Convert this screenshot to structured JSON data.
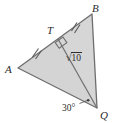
{
  "figure": {
    "kind": "geometry-diagram",
    "shape": "triangle with altitude/cevian",
    "width": 114,
    "height": 123,
    "background_color": "#ffffff",
    "fill_color": "#d4d4d4",
    "stroke_color": "#6e6e6e",
    "label_color": "#2b2b2b"
  },
  "vertices": {
    "A": {
      "label": "A",
      "x": 18,
      "y": 68
    },
    "B": {
      "label": "B",
      "x": 92,
      "y": 14
    },
    "Q": {
      "label": "Q",
      "x": 97,
      "y": 108
    },
    "T": {
      "label": "T",
      "x": 58,
      "y": 39
    }
  },
  "segments": {
    "AB": {
      "from": "A",
      "to": "B",
      "tick_count": 2
    },
    "BQ": {
      "from": "B",
      "to": "Q",
      "tick_count": 0
    },
    "QA": {
      "from": "Q",
      "to": "A",
      "tick_count": 0
    },
    "TQ": {
      "from": "T",
      "to": "Q",
      "tick_count": 0,
      "length_label": "√10"
    }
  },
  "marks": {
    "right_angle": {
      "at": "T",
      "symbol": "right-angle-square",
      "shown": true
    },
    "congruence_ticks": {
      "on_AT": {
        "count": 2,
        "x": 36,
        "y": 52
      },
      "on_TB": {
        "count": 2,
        "x": 75,
        "y": 26
      }
    },
    "angle_dot": {
      "at": "Q",
      "x": 88,
      "y": 100,
      "shown": true
    }
  },
  "labels": {
    "vertex_A": "A",
    "vertex_B": "B",
    "vertex_T": "T",
    "vertex_Q": "Q",
    "angle_at_Q": "30°",
    "segment_TQ_length": {
      "radical_symbol": "√",
      "radicand": "10",
      "full": "√10"
    }
  }
}
